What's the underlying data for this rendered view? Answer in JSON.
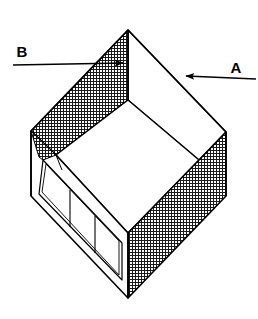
{
  "figure": {
    "kind": "isometric-line-drawing",
    "background_color": "#ffffff",
    "line_color": "#000000",
    "hatch_color": "#1a1a1a",
    "face_fill_color": "#ffffff",
    "stroke_width": 1.4,
    "thin_stroke_width": 1.0
  },
  "callouts": [
    {
      "id": "callout-a",
      "label": "A",
      "label_x": 236,
      "label_y": 73,
      "leader_start_x": 256,
      "leader_start_y": 79,
      "leader_end_x": 181,
      "leader_end_y": 76,
      "arrow_direction": "left",
      "target": "right-rear-top-edge"
    },
    {
      "id": "callout-b",
      "label": "B",
      "label_x": 16,
      "label_y": 60,
      "leader_start_x": 13,
      "leader_start_y": 65,
      "leader_end_x": 128,
      "leader_end_y": 63,
      "arrow_direction": "right",
      "target": "left-rear-top-edge-inner-corner"
    }
  ],
  "geometry": {
    "vertices": {
      "top_apex": {
        "x": 128,
        "y": 30
      },
      "left": {
        "x": 31,
        "y": 131
      },
      "right": {
        "x": 226,
        "y": 132
      },
      "bottom": {
        "x": 128,
        "y": 298
      },
      "rim_inner_top": {
        "x": 128,
        "y": 100
      },
      "rim_inner_left": {
        "x": 56,
        "y": 155
      },
      "rim_inner_right": {
        "x": 199,
        "y": 160
      },
      "rim_inner_bottom": {
        "x": 128,
        "y": 233
      },
      "left_outer_low": {
        "x": 31,
        "y": 196
      },
      "right_outer_low": {
        "x": 226,
        "y": 196
      }
    },
    "faces": [
      {
        "name": "left-rear-wall",
        "fill": "hatch"
      },
      {
        "name": "right-rear-wall",
        "fill": "plain"
      },
      {
        "name": "right-front-wall",
        "fill": "hatch"
      },
      {
        "name": "left-front-wall",
        "fill": "framed-panels"
      },
      {
        "name": "interior-floor",
        "fill": "plain"
      }
    ],
    "panel_count": 3
  }
}
